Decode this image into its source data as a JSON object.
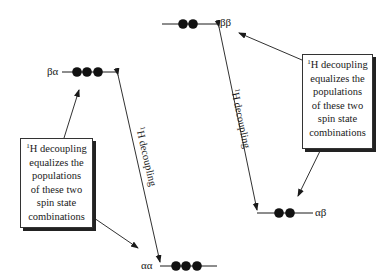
{
  "energy_levels": [
    {
      "id": "beta-beta",
      "label": "ββ",
      "dots": 2
    },
    {
      "id": "beta-alpha",
      "label": "βα",
      "dots": 3
    },
    {
      "id": "alpha-beta",
      "label": "αβ",
      "dots": 2
    },
    {
      "id": "alpha-alpha",
      "label": "αα",
      "dots": 3
    }
  ],
  "transitions": [
    {
      "id": "left-decoupling",
      "from": "αα",
      "to": "βα",
      "sup": "1",
      "label": "H decoupling"
    },
    {
      "id": "right-decoupling",
      "from": "ββ",
      "to": "αβ",
      "sup": "1",
      "label": "H decoupling"
    }
  ],
  "callouts": [
    {
      "id": "left-callout",
      "sup": "1",
      "lines": [
        "H decoupling",
        "equalizes the",
        "populations",
        "of these two",
        "spin state",
        "combinations"
      ],
      "points_to": [
        "βα",
        "αα"
      ]
    },
    {
      "id": "right-callout",
      "sup": "1",
      "lines": [
        "H decoupling",
        "equalizes the",
        "populations",
        "of these two",
        "spin state",
        "combinations"
      ],
      "points_to": [
        "ββ",
        "αβ"
      ]
    }
  ],
  "colors": {
    "ink": "#1a1a1a",
    "dot": "#111111",
    "background": "#ffffff"
  }
}
